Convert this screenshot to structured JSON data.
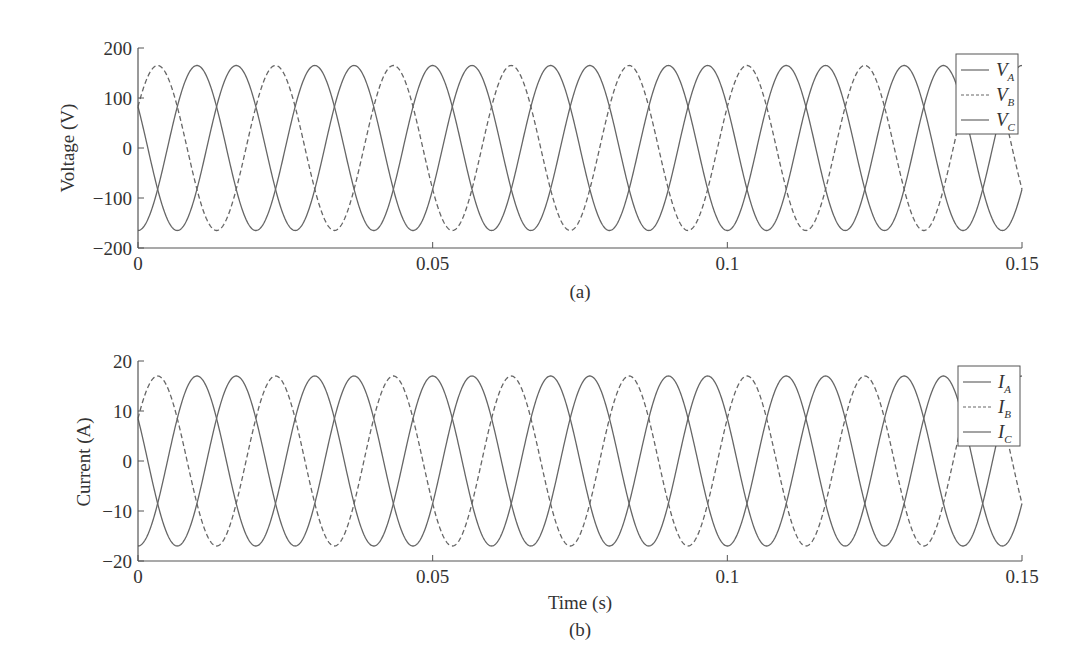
{
  "chart_data": [
    {
      "type": "line",
      "panel_label": "(a)",
      "xlabel": "",
      "ylabel": "Voltage (V)",
      "xlim": [
        0,
        0.15
      ],
      "ylim": [
        -200,
        200
      ],
      "xticks": [
        "0",
        "0.05",
        "0.1",
        "0.15"
      ],
      "yticks": [
        "200",
        "100",
        "0",
        "−100",
        "−200"
      ],
      "grid": false,
      "legend_position": "upper right",
      "frequency_hz": 50,
      "series": [
        {
          "name": "V_A",
          "label_main": "V",
          "label_sub": "A",
          "style": "solid",
          "amplitude": 165,
          "phase_deg": 150
        },
        {
          "name": "V_B",
          "label_main": "V",
          "label_sub": "B",
          "style": "dashed",
          "amplitude": 165,
          "phase_deg": 30
        },
        {
          "name": "V_C",
          "label_main": "V",
          "label_sub": "C",
          "style": "solid",
          "amplitude": 165,
          "phase_deg": -90
        }
      ]
    },
    {
      "type": "line",
      "panel_label": "(b)",
      "xlabel": "Time (s)",
      "ylabel": "Current (A)",
      "xlim": [
        0,
        0.15
      ],
      "ylim": [
        -20,
        20
      ],
      "xticks": [
        "0",
        "0.05",
        "0.1",
        "0.15"
      ],
      "yticks": [
        "20",
        "10",
        "0",
        "−10",
        "−20"
      ],
      "grid": false,
      "legend_position": "upper right",
      "frequency_hz": 50,
      "series": [
        {
          "name": "I_A",
          "label_main": "I",
          "label_sub": "A",
          "style": "solid",
          "amplitude": 17,
          "phase_deg": 150
        },
        {
          "name": "I_B",
          "label_main": "I",
          "label_sub": "B",
          "style": "dashed",
          "amplitude": 17,
          "phase_deg": 30
        },
        {
          "name": "I_C",
          "label_main": "I",
          "label_sub": "C",
          "style": "solid",
          "amplitude": 17,
          "phase_deg": -90
        }
      ]
    }
  ],
  "colors": {
    "line": "#666666",
    "axis": "#555555",
    "text": "#333333"
  }
}
